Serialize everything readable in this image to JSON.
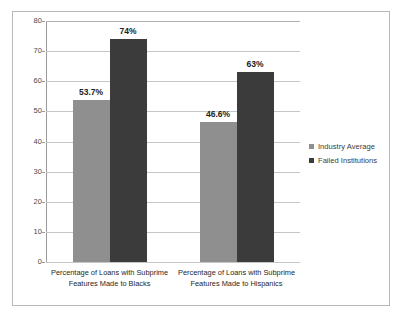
{
  "chart_data": {
    "type": "bar",
    "title": "",
    "xlabel": "",
    "ylabel": "",
    "ylim": [
      0,
      80
    ],
    "ytick_step": 10,
    "yticks": [
      "80",
      "70",
      "60",
      "50",
      "40",
      "30",
      "20",
      "10",
      "0"
    ],
    "grid": true,
    "legend_position": "right",
    "categories": [
      "Percentage of Loans with Subprime Features Made to Blacks",
      "Percentage of Loans with Subprime Features Made to Hispanics"
    ],
    "category_lines": [
      [
        "Percentage of Loans with Subprime",
        "Features Made to Blacks"
      ],
      [
        "Percentage of Loans with Subprime",
        "Features Made to Hispanics"
      ]
    ],
    "series": [
      {
        "name": "Industry Average",
        "color": "#8f8f8f",
        "values": [
          53.7,
          46.6
        ],
        "labels": [
          "53.7%",
          "46.6%"
        ]
      },
      {
        "name": "Failed Institutions",
        "color": "#3b3b3b",
        "values": [
          74,
          63
        ],
        "labels": [
          "74%",
          "63%"
        ]
      }
    ]
  },
  "legend": {
    "items": [
      {
        "label": "Industry Average",
        "color": "#8f8f8f"
      },
      {
        "label": "Failed Institutions",
        "color": "#3b3b3b"
      }
    ]
  },
  "style": {
    "frame_border": "#b9b9bd",
    "gridline": "#c6c6c8",
    "axis": "#9a9a9c",
    "tick_text": "#4a4a4a",
    "label_text": "#262626"
  }
}
